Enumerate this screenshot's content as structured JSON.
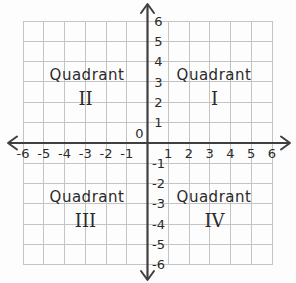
{
  "figure": {
    "background": "#fdfdfd",
    "grid_color": "#c4c4c4",
    "axis_color": "#3f3f3f",
    "label_color": "#2a2a2a"
  },
  "chart_data": {
    "type": "scatter",
    "title": "",
    "xlabel": "",
    "ylabel": "",
    "xlim": [
      -6,
      6
    ],
    "ylim": [
      -6,
      6
    ],
    "grid": true,
    "series": [],
    "x_tick_values": [
      -6,
      -5,
      -4,
      -3,
      -2,
      -1,
      1,
      2,
      3,
      4,
      5,
      6
    ],
    "x_tick_labels": [
      "-6",
      "-5",
      "-4",
      "-3",
      "-2",
      "-1",
      "1",
      "2",
      "3",
      "4",
      "5",
      "6"
    ],
    "y_tick_values": [
      6,
      5,
      4,
      3,
      2,
      1,
      -1,
      -2,
      -3,
      -4,
      -5,
      -6
    ],
    "y_tick_labels": [
      "6",
      "5",
      "4",
      "3",
      "2",
      "1",
      "-1",
      "-2",
      "-3",
      "-4",
      "-5",
      "-6"
    ],
    "origin_label": "0",
    "annotations": [
      {
        "quadrant": "top-right",
        "line1": "Quadrant",
        "line2": "I"
      },
      {
        "quadrant": "top-left",
        "line1": "Quadrant",
        "line2": "II"
      },
      {
        "quadrant": "bottom-left",
        "line1": "Quadrant",
        "line2": "III"
      },
      {
        "quadrant": "bottom-right",
        "line1": "Quadrant",
        "line2": "IV"
      }
    ]
  }
}
